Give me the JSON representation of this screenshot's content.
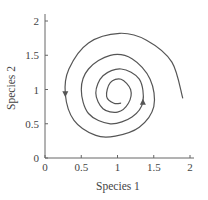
{
  "chart_data": {
    "type": "line",
    "title": "",
    "xlabel": "Species 1",
    "ylabel": "Species 2",
    "xlim": [
      0,
      2
    ],
    "ylim": [
      0,
      2
    ],
    "grid": false,
    "legend": null,
    "x_ticks": [
      "0",
      "0.5",
      "1",
      "1.5",
      "2"
    ],
    "y_ticks": [
      "0",
      "0.5",
      "1",
      "1.5",
      "2"
    ],
    "series": [
      {
        "name": "trajectory",
        "description": "Clockwise inward spiral converging to equilibrium near (1, 1)",
        "start": [
          1.9,
          0.87
        ],
        "end": [
          1.05,
          0.8
        ],
        "center": [
          1.0,
          1.0
        ],
        "turns": 3.5,
        "direction": "clockwise, spiraling inward",
        "color": "#555555",
        "points": [
          [
            1.9,
            0.87
          ],
          [
            1.75,
            1.4
          ],
          [
            1.4,
            1.72
          ],
          [
            1.03,
            1.82
          ],
          [
            0.6,
            1.68
          ],
          [
            0.33,
            1.3
          ],
          [
            0.28,
            0.93
          ],
          [
            0.4,
            0.55
          ],
          [
            0.7,
            0.33
          ],
          [
            0.97,
            0.32
          ],
          [
            1.3,
            0.45
          ],
          [
            1.5,
            0.75
          ],
          [
            1.45,
            1.15
          ],
          [
            1.2,
            1.45
          ],
          [
            0.9,
            1.5
          ],
          [
            0.6,
            1.3
          ],
          [
            0.5,
            1.0
          ],
          [
            0.6,
            0.65
          ],
          [
            0.9,
            0.5
          ],
          [
            1.2,
            0.6
          ],
          [
            1.35,
            0.82
          ],
          [
            1.3,
            1.15
          ],
          [
            1.05,
            1.3
          ],
          [
            0.8,
            1.2
          ],
          [
            0.7,
            0.95
          ],
          [
            0.8,
            0.72
          ],
          [
            1.0,
            0.67
          ],
          [
            1.15,
            0.8
          ],
          [
            1.18,
            1.0
          ],
          [
            1.05,
            1.15
          ],
          [
            0.9,
            1.1
          ],
          [
            0.85,
            0.9
          ],
          [
            0.95,
            0.8
          ],
          [
            1.05,
            0.8
          ]
        ]
      }
    ],
    "annotations": [
      {
        "type": "arrow",
        "at": [
          0.28,
          0.93
        ],
        "direction": "down"
      },
      {
        "type": "arrow",
        "at": [
          1.35,
          0.82
        ],
        "direction": "up"
      }
    ]
  }
}
